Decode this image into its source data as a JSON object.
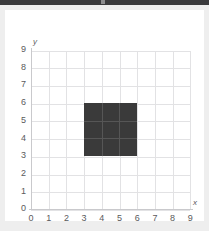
{
  "window": {
    "titlebar_color": "#3a3a3c",
    "page_background": "#eeeeee",
    "card_background": "#ffffff"
  },
  "chart_data": {
    "type": "scatter",
    "title": "",
    "xlabel": "x",
    "ylabel": "y",
    "xlim": [
      0,
      9
    ],
    "ylim": [
      0,
      9
    ],
    "grid": true,
    "legend": null,
    "x_ticks": [
      "0",
      "1",
      "2",
      "3",
      "4",
      "5",
      "6",
      "7",
      "8",
      "9"
    ],
    "y_ticks": [
      "0",
      "1",
      "2",
      "3",
      "4",
      "5",
      "6",
      "7",
      "8",
      "9"
    ],
    "x_tick_values": [
      0,
      1,
      2,
      3,
      4,
      5,
      6,
      7,
      8,
      9
    ],
    "y_tick_values": [
      0,
      1,
      2,
      3,
      4,
      5,
      6,
      7,
      8,
      9
    ],
    "grid_color": "#e2e2e4",
    "axis_color": "#c9c9cc",
    "tick_label_color": "#5a5a5c",
    "shapes": [
      {
        "name": "filled-square",
        "type": "rectangle",
        "x_min": 3,
        "x_max": 6,
        "y_min": 3,
        "y_max": 6,
        "width_units": 3,
        "height_units": 3,
        "area_units": 9,
        "fill": "#3a3a3a",
        "interior_gridline_color": "#565656",
        "vertices": [
          [
            3,
            3
          ],
          [
            6,
            3
          ],
          [
            6,
            6
          ],
          [
            3,
            6
          ]
        ]
      }
    ]
  }
}
